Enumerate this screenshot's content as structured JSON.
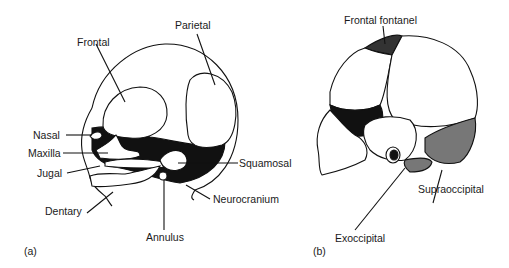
{
  "figure": {
    "panel_a": {
      "tag": "(a)",
      "labels": {
        "frontal": "Frontal",
        "parietal": "Parietal",
        "nasal": "Nasal",
        "maxilla": "Maxilla",
        "jugal": "Jugal",
        "dentary": "Dentary",
        "squamosal": "Squamosal",
        "neurocranium": "Neurocranium",
        "annulus": "Annulus"
      }
    },
    "panel_b": {
      "tag": "(b)",
      "labels": {
        "frontal_fontanel": "Frontal fontanel",
        "supraoccipital": "Supraoccipital",
        "exoccipital": "Exoccipital"
      }
    }
  }
}
